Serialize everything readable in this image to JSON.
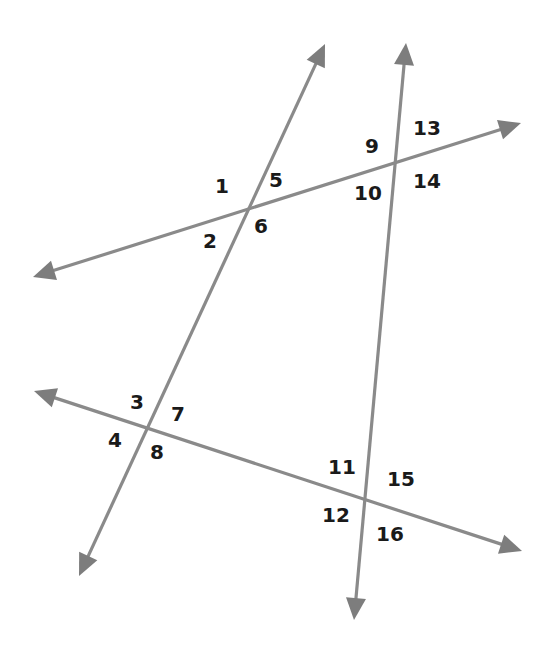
{
  "diagram": {
    "type": "two transversals crossing two lines",
    "colors": {
      "line": "#8a8a8a",
      "arrowhead": "#7d7d7d",
      "label": "#1a1a1a",
      "background": "#ffffff"
    },
    "lines": [
      {
        "id": "transversal-left",
        "from": [
          79,
          576
        ],
        "to": [
          325,
          44
        ]
      },
      {
        "id": "transversal-right",
        "from": [
          354,
          620
        ],
        "to": [
          406,
          43
        ]
      },
      {
        "id": "line-upper",
        "from": [
          33,
          277
        ],
        "to": [
          521,
          123
        ]
      },
      {
        "id": "line-lower",
        "from": [
          34,
          391
        ],
        "to": [
          522,
          551
        ]
      }
    ],
    "intersections": [
      {
        "id": "upper-left",
        "point": [
          247,
          210
        ]
      },
      {
        "id": "upper-right",
        "point": [
          397,
          162
        ]
      },
      {
        "id": "lower-left",
        "point": [
          146,
          429
        ]
      },
      {
        "id": "lower-right",
        "point": [
          365,
          500
        ]
      }
    ],
    "labels": [
      {
        "text": "1",
        "x": 222,
        "y": 187
      },
      {
        "text": "2",
        "x": 210,
        "y": 242
      },
      {
        "text": "3",
        "x": 137,
        "y": 403
      },
      {
        "text": "4",
        "x": 115,
        "y": 441
      },
      {
        "text": "5",
        "x": 276,
        "y": 181
      },
      {
        "text": "6",
        "x": 261,
        "y": 227
      },
      {
        "text": "7",
        "x": 178,
        "y": 415
      },
      {
        "text": "8",
        "x": 157,
        "y": 453
      },
      {
        "text": "9",
        "x": 372,
        "y": 147
      },
      {
        "text": "10",
        "x": 368,
        "y": 194
      },
      {
        "text": "11",
        "x": 342,
        "y": 468
      },
      {
        "text": "12",
        "x": 336,
        "y": 516
      },
      {
        "text": "13",
        "x": 427,
        "y": 129
      },
      {
        "text": "14",
        "x": 427,
        "y": 182
      },
      {
        "text": "15",
        "x": 401,
        "y": 480
      },
      {
        "text": "16",
        "x": 390,
        "y": 535
      }
    ]
  }
}
